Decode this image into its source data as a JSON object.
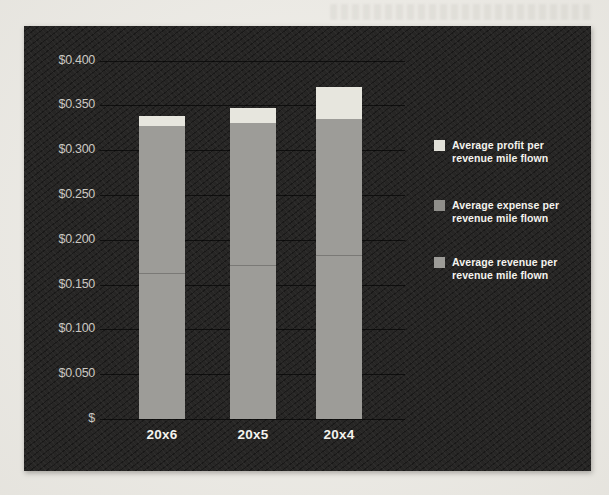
{
  "chart_data": {
    "type": "bar",
    "stacked": true,
    "title": "",
    "xlabel": "",
    "ylabel": "",
    "categories": [
      "20x6",
      "20x5",
      "20x4"
    ],
    "series": [
      {
        "name": "Average revenue per revenue mile flown",
        "values": [
          0.163,
          0.172,
          0.183
        ]
      },
      {
        "name": "Average expense per revenue mile flown",
        "values": [
          0.164,
          0.158,
          0.152
        ]
      },
      {
        "name": "Average profit per revenue mile flown",
        "values": [
          0.011,
          0.017,
          0.036
        ]
      }
    ],
    "totals": [
      0.338,
      0.347,
      0.371
    ],
    "ylim": [
      0,
      0.4
    ],
    "ytick_step": 0.05,
    "ytick_labels": [
      "$",
      "$0.050",
      "$0.100",
      "$0.150",
      "$0.200",
      "$0.250",
      "$0.300",
      "$0.350",
      "$0.400"
    ],
    "grid": true,
    "legend_position": "right",
    "legend": [
      {
        "label": "Average profit per revenue mile flown",
        "color": "#e2e1d9"
      },
      {
        "label": "Average expense per revenue mile flown",
        "color": "#8f8e8a"
      },
      {
        "label": "Average revenue per revenue mile flown",
        "color": "#9d9c98"
      }
    ]
  },
  "colors": {
    "page_background": "#efede7",
    "chart_background": "#242322",
    "grid_line": "rgba(0,0,0,0.62)",
    "ytick_text": "#cbc8c2",
    "xtick_text": "#f4f3ee",
    "legend_text": "#f4f3ee",
    "bar_gray": "#9d9c98",
    "bar_light": "#e7e6de",
    "segment_divider": "rgba(0,0,0,0.22)"
  }
}
